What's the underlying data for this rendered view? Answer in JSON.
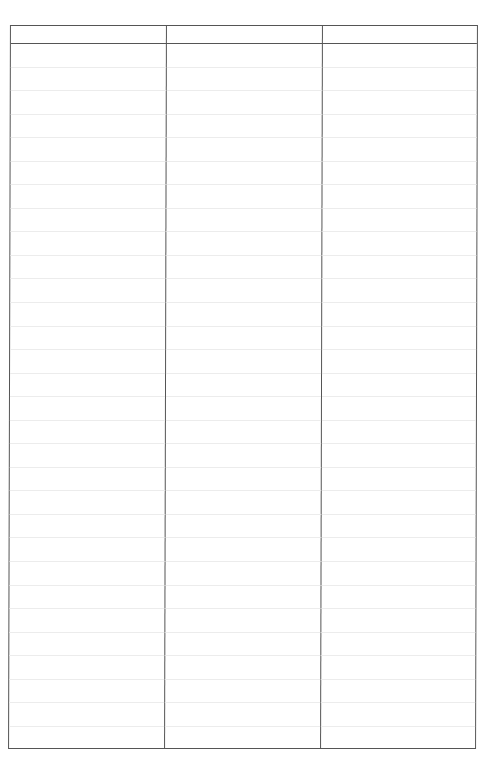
{
  "table": {
    "headers": [
      "",
      "",
      ""
    ],
    "row_count": 30,
    "rows": [],
    "colors": {
      "border": "#555555",
      "rule": "#ececec",
      "background": "#ffffff"
    }
  }
}
